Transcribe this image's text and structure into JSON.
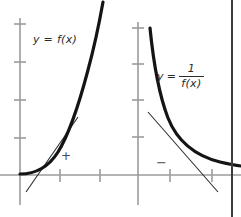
{
  "figure": {
    "background_color": "#ffffff",
    "border_color": "#3d3d3d",
    "axis_color": "#9b9b9b",
    "curve_color": "#1a1a1a",
    "tangent_color": "#2b2b2b",
    "label_color": "#2b2b2b"
  },
  "panels": [
    {
      "id": "left",
      "label": {
        "type": "plain",
        "text": "y = f(x)"
      },
      "sign_annotation": {
        "symbol": "+",
        "name": "plus-sign"
      },
      "axes": {
        "x_axis_y": 175,
        "y_axis_x": 20,
        "y_ticks": [
          24,
          62,
          100,
          138
        ],
        "x_ticks": [
          60,
          100
        ]
      },
      "curve": {
        "kind": "increasing-convex",
        "description": "exponential-like curve rising from near the x-axis to the top right",
        "path": "M 20 174 C 34 174, 48 168, 58 152 C 68 136, 78 108, 88 70 C 94 48, 98 30, 103 2"
      },
      "tangent": {
        "description": "tangent line with positive slope touching the curve",
        "x1": 26,
        "y1": 192,
        "x2": 78,
        "y2": 117
      }
    },
    {
      "id": "right",
      "label": {
        "type": "fraction",
        "lhs": "y",
        "equals": "=",
        "numerator": "1",
        "denominator": "f(x)"
      },
      "sign_annotation": {
        "symbol": "−",
        "name": "minus-sign"
      },
      "axes": {
        "x_axis_y": 175,
        "y_axis_x": 18,
        "y_ticks": [
          28,
          64,
          100,
          137
        ],
        "x_ticks": [
          50,
          92
        ]
      },
      "curve": {
        "kind": "decreasing-convex",
        "description": "reciprocal curve falling steeply then flattening toward the x-axis",
        "path": "M 30 28 C 33 58, 38 92, 48 118 C 58 143, 76 156, 100 162 C 113 165, 121 166, 121 166"
      },
      "tangent": {
        "description": "tangent line with negative slope touching the curve",
        "x1": 28,
        "y1": 112,
        "x2": 98,
        "y2": 192
      }
    }
  ]
}
